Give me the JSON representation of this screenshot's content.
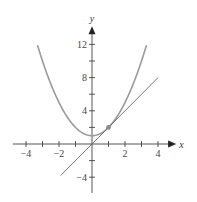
{
  "chart_data": {
    "type": "line",
    "title": "",
    "xlabel": "x",
    "ylabel": "y",
    "xlim": [
      -4.8,
      5.1
    ],
    "ylim": [
      -5.9,
      14.2
    ],
    "grid": false,
    "legend": null,
    "x_ticks": [
      -4,
      -3,
      -2,
      -1,
      1,
      2,
      3,
      4
    ],
    "x_tick_labels": [
      "−4",
      "−2",
      "2",
      "4"
    ],
    "x_tick_label_values": [
      -4,
      -2,
      2,
      4
    ],
    "y_ticks": [
      -4,
      -2,
      2,
      4,
      6,
      8,
      10,
      12
    ],
    "y_tick_labels": [
      "−4",
      "4",
      "8",
      "12"
    ],
    "y_tick_label_values": [
      -4,
      4,
      8,
      12
    ],
    "series": [
      {
        "name": "parabola",
        "equation": "y = x^2 + 1",
        "x": [
          -3.3,
          -3,
          -2.5,
          -2,
          -1.5,
          -1,
          -0.5,
          0,
          0.5,
          1,
          1.5,
          2,
          2.5,
          3,
          3.3
        ],
        "values": [
          11.89,
          10,
          7.25,
          5,
          3.25,
          2,
          1.25,
          1,
          1.25,
          2,
          3.25,
          5,
          7.25,
          10,
          11.89
        ],
        "color": "#9a9a9a"
      },
      {
        "name": "tangent line",
        "equation": "y = 2x",
        "x": [
          -1.9,
          4
        ],
        "values": [
          -3.8,
          8
        ],
        "color": "#666666"
      }
    ],
    "annotations": [
      {
        "type": "point",
        "x": 1,
        "y": 2,
        "label": "",
        "description": "point of tangency"
      }
    ]
  }
}
